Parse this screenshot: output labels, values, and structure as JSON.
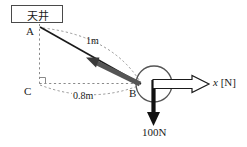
{
  "figure": {
    "type": "physics-force-diagram",
    "title_box": {
      "text": "天井",
      "meaning": "ceiling"
    },
    "points": {
      "A": {
        "label": "A",
        "x": 40,
        "y": 27,
        "role": "anchor-on-ceiling"
      },
      "B": {
        "label": "B",
        "x": 140,
        "y": 84,
        "role": "ball-attachment"
      },
      "C": {
        "label": "C",
        "x": 39,
        "y": 84,
        "role": "right-angle-corner"
      }
    },
    "dimensions": [
      {
        "name": "string-length",
        "label": "1m",
        "value": 1,
        "unit": "m",
        "from": "A",
        "to": "B"
      },
      {
        "name": "horizontal-distance",
        "label": "0.8m",
        "value": 0.8,
        "unit": "m",
        "from": "C",
        "to": "B"
      }
    ],
    "forces": [
      {
        "name": "weight",
        "label": "100N",
        "value": 100,
        "unit": "N",
        "direction": "down",
        "style": "solid-black-arrow"
      },
      {
        "name": "applied-horizontal",
        "label": "x [N]",
        "symbol": "x",
        "unit": "N",
        "direction": "right",
        "style": "hollow-outline-arrow"
      },
      {
        "name": "string-tension",
        "label": "",
        "direction": "up-left-toward-A",
        "style": "thick-gray-arrow"
      }
    ],
    "ball": {
      "name": "ball",
      "cx": 154,
      "cy": 84,
      "r": 18
    },
    "right_angle_marker": {
      "at": "C",
      "shown": true
    },
    "colors": {
      "ink": "#1a1a1a",
      "box_border": "#4a4a4a",
      "dashed_guide": "#8a8a8a",
      "tension_arrow": "#555555",
      "ball_outline": "#555555"
    }
  }
}
